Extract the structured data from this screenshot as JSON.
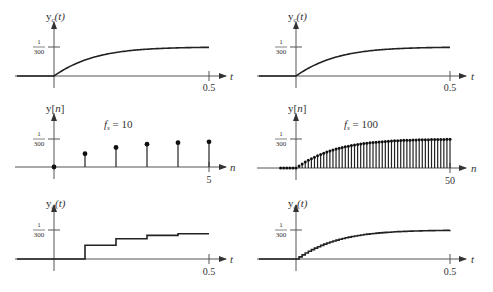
{
  "chart_data": [
    {
      "id": "top-left",
      "type": "line",
      "title": "",
      "ylabel": "y_c(t)",
      "ylabel_main": "y",
      "ylabel_sub": "c",
      "ylabel_arg": "(t)",
      "xlabel": "t",
      "x_tick_labels": [
        "0.5"
      ],
      "y_tick_label_num": "1",
      "y_tick_label_den": "300",
      "y_tick_value": 0.003333,
      "xlim": [
        -0.2,
        0.5
      ],
      "description": "continuous-time step response rising from 0 at t=0 to approach 1/300",
      "x": [
        0,
        0.05,
        0.1,
        0.15,
        0.2,
        0.25,
        0.3,
        0.35,
        0.4,
        0.45,
        0.5
      ],
      "y": [
        0,
        0.00131,
        0.00211,
        0.00259,
        0.00288,
        0.00306,
        0.00317,
        0.00323,
        0.00327,
        0.0033,
        0.00331
      ]
    },
    {
      "id": "top-right",
      "type": "line",
      "ylabel": "y_c(t)",
      "ylabel_main": "y",
      "ylabel_sub": "c",
      "ylabel_arg": "(t)",
      "xlabel": "t",
      "x_tick_labels": [
        "0.5"
      ],
      "y_tick_label_num": "1",
      "y_tick_label_den": "300",
      "xlim": [
        -0.2,
        0.5
      ],
      "x": [
        0,
        0.05,
        0.1,
        0.15,
        0.2,
        0.25,
        0.3,
        0.35,
        0.4,
        0.45,
        0.5
      ],
      "y": [
        0,
        0.00131,
        0.00211,
        0.00259,
        0.00288,
        0.00306,
        0.00317,
        0.00323,
        0.00327,
        0.0033,
        0.00331
      ]
    },
    {
      "id": "middle-left",
      "type": "stem",
      "annotation": "f_s = 10",
      "annotation_main": "f",
      "annotation_sub": "s",
      "annotation_rest": " = 10",
      "ylabel": "y[n]",
      "ylabel_main": "y[",
      "ylabel_var": "n",
      "ylabel_close": "]",
      "xlabel": "n",
      "x_tick_labels": [
        "5"
      ],
      "y_tick_label_num": "1",
      "y_tick_label_den": "300",
      "n": [
        0,
        1,
        2,
        3,
        4,
        5
      ],
      "values": [
        0,
        0.00158,
        0.00232,
        0.00272,
        0.0029,
        0.003
      ]
    },
    {
      "id": "middle-right",
      "type": "stem",
      "annotation": "f_s = 100",
      "annotation_main": "f",
      "annotation_sub": "s",
      "annotation_rest": " = 100",
      "ylabel": "y[n]",
      "ylabel_main": "y[",
      "ylabel_var": "n",
      "ylabel_close": "]",
      "xlabel": "n",
      "x_tick_labels": [
        "50"
      ],
      "y_tick_label_num": "1",
      "y_tick_label_den": "300",
      "n_range": [
        -5,
        50
      ],
      "description": "51 dense samples of the step response from n=0 to n=50, approaching 1/300; zero-valued samples for n<0"
    },
    {
      "id": "bottom-left",
      "type": "line",
      "style": "staircase (zero-order hold)",
      "ylabel": "y_d(t)",
      "ylabel_main": "y",
      "ylabel_sub": "d",
      "ylabel_arg": "(t)",
      "xlabel": "t",
      "x_tick_labels": [
        "0.5"
      ],
      "y_tick_label_num": "1",
      "y_tick_label_den": "300",
      "step_times": [
        0.1,
        0.2,
        0.3,
        0.4,
        0.5
      ],
      "step_values": [
        0.00158,
        0.00232,
        0.00272,
        0.0029,
        0.003
      ]
    },
    {
      "id": "bottom-right",
      "type": "line",
      "style": "fine staircase (f_s = 100)",
      "ylabel": "y_d(t)",
      "ylabel_main": "y",
      "ylabel_sub": "d",
      "ylabel_arg": "(t)",
      "xlabel": "t",
      "x_tick_labels": [
        "0.5"
      ],
      "y_tick_label_num": "1",
      "y_tick_label_den": "300"
    }
  ]
}
